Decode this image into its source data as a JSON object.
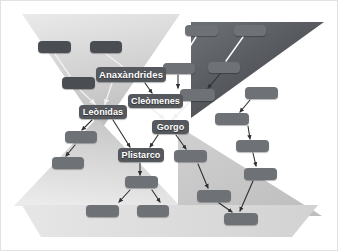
{
  "diagram": {
    "type": "genealogy-tree",
    "background_color": "#ffffff",
    "palette": {
      "dark_node": "#4a4d52",
      "mid_node": "#6e7176",
      "label_node": "#55585d",
      "faint_node": "#7c7f84",
      "dark_triangle": "#53565b",
      "light_triangle": "#d6d6d6",
      "pale_triangle": "#e8e8e8",
      "connector_light": "#f2f2f2",
      "connector_dark": "#2f3135",
      "text": "#ffffff"
    },
    "shapes": [
      {
        "name": "light-inverted-triangle-top-left",
        "points": "22,14 175,14 100,128",
        "fill": "#dcdcdc"
      },
      {
        "name": "dark-triangle-top-right",
        "points": "190,22 323,22 190,118",
        "fill": "#53565b"
      },
      {
        "name": "light-triangle-bottom-left",
        "points": "95,120 14,205 178,205",
        "fill": "#d9d9d9"
      },
      {
        "name": "light-triangle-bottom-right",
        "points": "178,128 320,215 178,215",
        "fill": "#d0d0d0"
      },
      {
        "name": "pale-band-bottom",
        "points": "22,205 316,205 290,236 40,236",
        "fill": "#e4e4e4"
      }
    ],
    "labeled_nodes": [
      {
        "id": "anaxandrides",
        "label": "Anaxàndrides",
        "x": 96,
        "y": 67,
        "w": 70,
        "h": 15,
        "style": "label",
        "font_size": 9.5
      },
      {
        "id": "cleomenes",
        "label": "Cleòmenes",
        "x": 128,
        "y": 94,
        "w": 55,
        "h": 14,
        "style": "label",
        "font_size": 9
      },
      {
        "id": "leonidas",
        "label": "Leònidas",
        "x": 79,
        "y": 105,
        "w": 48,
        "h": 14,
        "style": "label",
        "font_size": 9
      },
      {
        "id": "gorgo",
        "label": "Gorgo",
        "x": 152,
        "y": 120,
        "w": 37,
        "h": 14,
        "style": "label",
        "font_size": 9
      },
      {
        "id": "plistarco",
        "label": "Plistarco",
        "x": 118,
        "y": 148,
        "w": 46,
        "h": 14,
        "style": "label",
        "font_size": 9
      }
    ],
    "blank_nodes": [
      {
        "id": "n-tl-1",
        "x": 38,
        "y": 41,
        "w": 33,
        "h": 12,
        "style": "dark"
      },
      {
        "id": "n-tl-2",
        "x": 90,
        "y": 41,
        "w": 32,
        "h": 12,
        "style": "dark"
      },
      {
        "id": "n-tl-3",
        "x": 62,
        "y": 77,
        "w": 33,
        "h": 12,
        "style": "dark"
      },
      {
        "id": "n-tr-1",
        "x": 185,
        "y": 25,
        "w": 33,
        "h": 11,
        "style": "mid"
      },
      {
        "id": "n-tr-2",
        "x": 234,
        "y": 25,
        "w": 32,
        "h": 11,
        "style": "mid"
      },
      {
        "id": "n-tr-3",
        "x": 163,
        "y": 63,
        "w": 32,
        "h": 11,
        "style": "mid"
      },
      {
        "id": "n-tr-4",
        "x": 208,
        "y": 62,
        "w": 32,
        "h": 11,
        "style": "mid"
      },
      {
        "id": "n-tr-5",
        "x": 180,
        "y": 89,
        "w": 35,
        "h": 12,
        "style": "mid"
      },
      {
        "id": "n-r-1",
        "x": 245,
        "y": 87,
        "w": 33,
        "h": 12,
        "style": "mid"
      },
      {
        "id": "n-r-2",
        "x": 215,
        "y": 113,
        "w": 34,
        "h": 12,
        "style": "mid"
      },
      {
        "id": "n-r-3",
        "x": 236,
        "y": 140,
        "w": 33,
        "h": 12,
        "style": "mid"
      },
      {
        "id": "n-r-4",
        "x": 244,
        "y": 168,
        "w": 33,
        "h": 12,
        "style": "mid"
      },
      {
        "id": "n-m-1",
        "x": 174,
        "y": 150,
        "w": 33,
        "h": 12,
        "style": "mid"
      },
      {
        "id": "n-m-2",
        "x": 197,
        "y": 190,
        "w": 34,
        "h": 12,
        "style": "mid"
      },
      {
        "id": "n-m-3",
        "x": 224,
        "y": 213,
        "w": 34,
        "h": 12,
        "style": "mid"
      },
      {
        "id": "n-bl-1",
        "x": 65,
        "y": 131,
        "w": 32,
        "h": 12,
        "style": "mid"
      },
      {
        "id": "n-bl-2",
        "x": 52,
        "y": 157,
        "w": 32,
        "h": 12,
        "style": "mid"
      },
      {
        "id": "n-b-1",
        "x": 125,
        "y": 176,
        "w": 33,
        "h": 12,
        "style": "mid"
      },
      {
        "id": "n-b-2",
        "x": 86,
        "y": 205,
        "w": 33,
        "h": 12,
        "style": "mid"
      },
      {
        "id": "n-b-3",
        "x": 137,
        "y": 205,
        "w": 32,
        "h": 12,
        "style": "mid"
      }
    ],
    "connectors": [
      {
        "from": "n-tl-1",
        "to": "n-tl-3",
        "x1": 55,
        "y1": 54,
        "x2": 70,
        "y2": 76,
        "color": "#f0f0f0",
        "arrow": false
      },
      {
        "from": "n-tl-2",
        "to": "anaxandrides",
        "x1": 106,
        "y1": 54,
        "x2": 122,
        "y2": 66,
        "color": "#f0f0f0",
        "arrow": false
      },
      {
        "from": "n-tl-3",
        "to": "leonidas",
        "x1": 80,
        "y1": 90,
        "x2": 95,
        "y2": 104,
        "color": "#f0f0f0",
        "arrow": true
      },
      {
        "from": "anaxandrides",
        "to": "leonidas",
        "x1": 112,
        "y1": 83,
        "x2": 105,
        "y2": 104,
        "color": "#f0f0f0",
        "arrow": true
      },
      {
        "from": "anaxandrides",
        "to": "cleomenes",
        "x1": 145,
        "y1": 83,
        "x2": 152,
        "y2": 93,
        "color": "#2f3135",
        "arrow": true
      },
      {
        "from": "n-tr-1",
        "to": "n-tr-3",
        "x1": 196,
        "y1": 37,
        "x2": 180,
        "y2": 62,
        "color": "#ffffff",
        "arrow": false
      },
      {
        "from": "n-tr-2",
        "to": "n-tr-4",
        "x1": 243,
        "y1": 37,
        "x2": 226,
        "y2": 61,
        "color": "#ffffff",
        "arrow": false
      },
      {
        "from": "n-tr-3",
        "to": "n-tr-5",
        "x1": 178,
        "y1": 75,
        "x2": 178,
        "y2": 88,
        "color": "#2f3135",
        "arrow": true
      },
      {
        "from": "n-tr-4",
        "to": "n-tr-5",
        "x1": 220,
        "y1": 74,
        "x2": 208,
        "y2": 88,
        "color": "#2f3135",
        "arrow": true
      },
      {
        "from": "n-tr-5",
        "to": "gorgo",
        "x1": 190,
        "y1": 102,
        "x2": 173,
        "y2": 119,
        "color": "#f0f0f0",
        "arrow": true
      },
      {
        "from": "cleomenes",
        "to": "gorgo",
        "x1": 152,
        "y1": 109,
        "x2": 164,
        "y2": 119,
        "color": "#f0f0f0",
        "arrow": true
      },
      {
        "from": "n-r-1",
        "to": "n-r-2",
        "x1": 250,
        "y1": 100,
        "x2": 240,
        "y2": 112,
        "color": "#2f3135",
        "arrow": true
      },
      {
        "from": "n-r-2",
        "to": "n-r-3",
        "x1": 248,
        "y1": 126,
        "x2": 250,
        "y2": 139,
        "color": "#2f3135",
        "arrow": true
      },
      {
        "from": "n-r-3",
        "to": "n-r-4",
        "x1": 253,
        "y1": 153,
        "x2": 256,
        "y2": 166,
        "color": "#2f3135",
        "arrow": true
      },
      {
        "from": "n-r-4",
        "to": "n-m-3",
        "x1": 253,
        "y1": 181,
        "x2": 240,
        "y2": 211,
        "color": "#2f3135",
        "arrow": true
      },
      {
        "from": "leonidas",
        "to": "n-bl-1",
        "x1": 92,
        "y1": 120,
        "x2": 82,
        "y2": 130,
        "color": "#2f3135",
        "arrow": true
      },
      {
        "from": "leonidas",
        "to": "plistarco",
        "x1": 113,
        "y1": 120,
        "x2": 130,
        "y2": 147,
        "color": "#2f3135",
        "arrow": true
      },
      {
        "from": "n-bl-1",
        "to": "n-bl-2",
        "x1": 75,
        "y1": 145,
        "x2": 66,
        "y2": 156,
        "color": "#2f3135",
        "arrow": true
      },
      {
        "from": "plistarco",
        "to": "n-b-1",
        "x1": 140,
        "y1": 163,
        "x2": 140,
        "y2": 175,
        "color": "#2f3135",
        "arrow": true
      },
      {
        "from": "n-b-1",
        "to": "n-b-2",
        "x1": 130,
        "y1": 190,
        "x2": 119,
        "y2": 202,
        "color": "#2f3135",
        "arrow": true
      },
      {
        "from": "n-b-1",
        "to": "n-b-3",
        "x1": 152,
        "y1": 190,
        "x2": 160,
        "y2": 202,
        "color": "#2f3135",
        "arrow": true
      },
      {
        "from": "gorgo",
        "to": "n-m-1",
        "x1": 176,
        "y1": 135,
        "x2": 186,
        "y2": 149,
        "color": "#2f3135",
        "arrow": true
      },
      {
        "from": "gorgo",
        "to": "plistarco",
        "x1": 158,
        "y1": 135,
        "x2": 150,
        "y2": 147,
        "color": "#2f3135",
        "arrow": true
      },
      {
        "from": "n-m-1",
        "to": "n-m-2",
        "x1": 198,
        "y1": 164,
        "x2": 208,
        "y2": 188,
        "color": "#2f3135",
        "arrow": true
      },
      {
        "from": "n-m-2",
        "to": "n-m-3",
        "x1": 219,
        "y1": 203,
        "x2": 232,
        "y2": 212,
        "color": "#2f3135",
        "arrow": true
      }
    ]
  }
}
